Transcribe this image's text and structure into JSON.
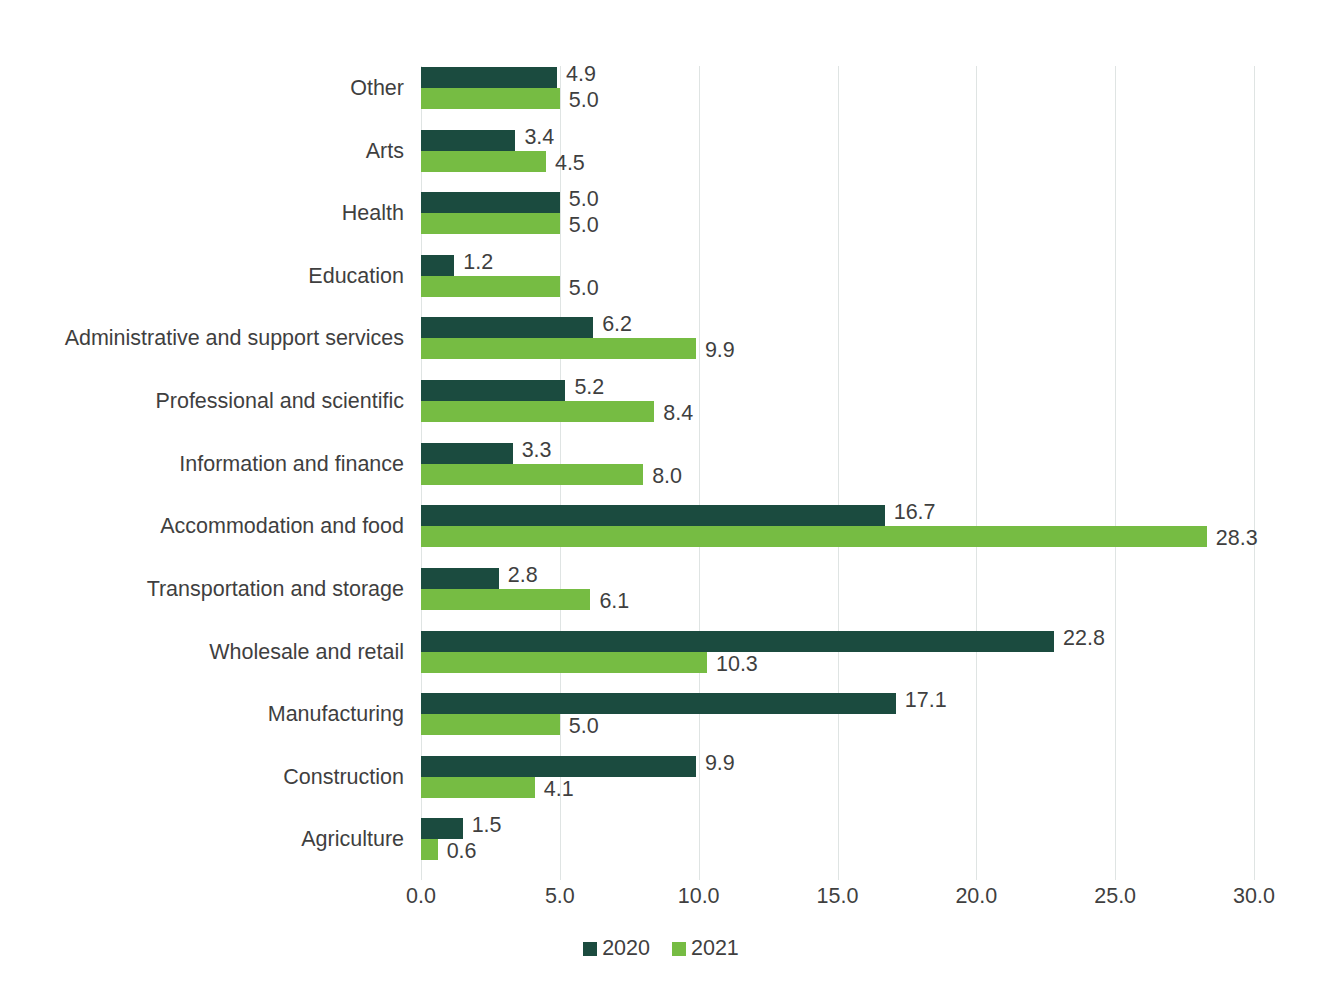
{
  "chart_data": {
    "type": "bar",
    "orientation": "horizontal",
    "title": "",
    "subtitle": "",
    "xlabel": "",
    "ylabel": "",
    "xlim": [
      0.0,
      30.0
    ],
    "xticks": [
      "0.0",
      "5.0",
      "10.0",
      "15.0",
      "20.0",
      "25.0",
      "30.0"
    ],
    "xtick_values": [
      0,
      5,
      10,
      15,
      20,
      25,
      30
    ],
    "grid": true,
    "legend_position": "bottom-center",
    "categories": [
      "Other",
      "Arts",
      "Health",
      "Education",
      "Administrative and support services",
      "Professional and scientific",
      "Information and finance",
      "Accommodation and food",
      "Transportation and storage",
      "Wholesale and retail",
      "Manufacturing",
      "Construction",
      "Agriculture"
    ],
    "series": [
      {
        "name": "2020",
        "color": "#1b4b3f",
        "values": [
          4.9,
          3.4,
          5.0,
          1.2,
          6.2,
          5.2,
          3.3,
          16.7,
          2.8,
          22.8,
          17.1,
          9.9,
          1.5
        ],
        "labels": [
          "4.9",
          "3.4",
          "5.0",
          "1.2",
          "6.2",
          "5.2",
          "3.3",
          "16.7",
          "2.8",
          "22.8",
          "17.1",
          "9.9",
          "1.5"
        ]
      },
      {
        "name": "2021",
        "color": "#76bc43",
        "values": [
          5.0,
          4.5,
          5.0,
          5.0,
          9.9,
          8.4,
          8.0,
          28.3,
          6.1,
          10.3,
          5.0,
          4.1,
          0.6
        ],
        "labels": [
          "5.0",
          "4.5",
          "5.0",
          "5.0",
          "9.9",
          "8.4",
          "8.0",
          "28.3",
          "6.1",
          "10.3",
          "5.0",
          "4.1",
          "0.6"
        ]
      }
    ]
  },
  "legend": {
    "items": [
      {
        "label": "2020",
        "color": "#1b4b3f"
      },
      {
        "label": "2021",
        "color": "#76bc43"
      }
    ]
  },
  "colors": {
    "series_2020": "#1b4b3f",
    "series_2021": "#76bc43",
    "gridline": "#dfe4e3",
    "text": "#3f3f3f",
    "background": "#ffffff"
  }
}
